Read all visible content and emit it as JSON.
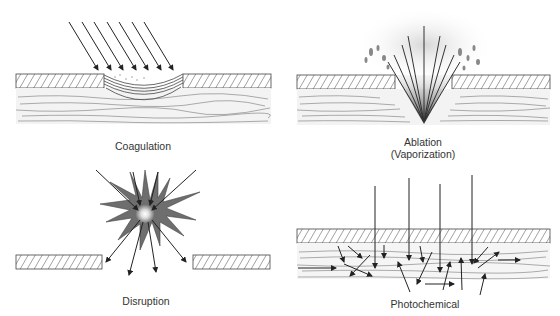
{
  "figure": {
    "panels": [
      {
        "id": "coagulation",
        "label": "Coagulation"
      },
      {
        "id": "ablation",
        "label_line1": "Ablation",
        "label_line2": "(Vaporization)"
      },
      {
        "id": "disruption",
        "label": "Disruption"
      },
      {
        "id": "photochemical",
        "label": "Photochemical"
      }
    ]
  },
  "colors": {
    "line": "#222222",
    "hatch": "#444444",
    "tissue_fiber": "#777777",
    "spark_fill": "#6e6e6e",
    "smoke": "#9a9a9a"
  }
}
